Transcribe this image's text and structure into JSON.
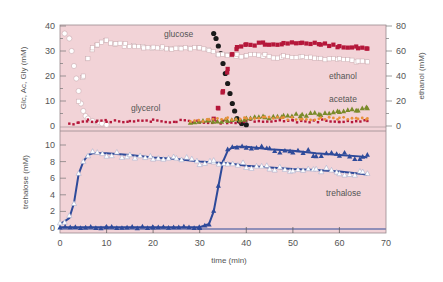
{
  "chart_data": [
    {
      "type": "scatter",
      "panel": "top",
      "xlabel": "time (min)",
      "ylabel": "Glc, Ac, Gly (mM)",
      "ylabel_right": "ethanol (mM)",
      "xlim": [
        0,
        70
      ],
      "ylim": [
        0,
        40
      ],
      "ylim_right": [
        0,
        80
      ],
      "yticks": [
        0,
        10,
        20,
        30,
        40
      ],
      "yticks_right": [
        0,
        20,
        40,
        60,
        80
      ],
      "background": "#f2d3d7",
      "annotations": [
        "glucose",
        "glycerol",
        "ethanol",
        "acetate"
      ],
      "series": [
        {
          "name": "glucose (open circles, phase 1)",
          "axis": "left",
          "marker": "open-circle",
          "color": "#ffffff",
          "x": [
            1,
            2,
            2.5,
            3,
            3.5,
            4,
            4.5,
            5,
            5.5,
            6,
            7,
            8,
            9,
            10
          ],
          "y": [
            37,
            35,
            30,
            24,
            19,
            14,
            9,
            6,
            4,
            3,
            2,
            1.5,
            1,
            0.5
          ]
        },
        {
          "name": "glucose (black circles, phase 2)",
          "axis": "left",
          "marker": "filled-circle",
          "color": "#1a1a1a",
          "x": [
            33,
            33.5,
            34,
            34.5,
            35,
            35.5,
            36,
            36.5,
            37,
            37.5,
            38,
            38.5,
            39,
            40
          ],
          "y": [
            37,
            35,
            32,
            29,
            25,
            21,
            17,
            13,
            9,
            6,
            3,
            2,
            1,
            0.5
          ]
        },
        {
          "name": "ethanol (open squares)",
          "axis": "right",
          "marker": "open-square",
          "color": "#ffffff",
          "x": [
            4,
            5,
            6,
            7,
            8,
            10,
            12,
            14,
            16,
            18,
            20,
            22,
            24,
            26,
            28,
            30,
            32,
            34,
            36,
            38,
            40,
            44,
            48,
            52,
            56,
            60,
            64,
            66
          ],
          "y": [
            20,
            40,
            55,
            62,
            66,
            68,
            66,
            65,
            64,
            63,
            62,
            63,
            62,
            62,
            62,
            63,
            60,
            58,
            57,
            56,
            57,
            56,
            55,
            55,
            54,
            53,
            52,
            51
          ]
        },
        {
          "name": "ethanol (red squares)",
          "axis": "right",
          "marker": "filled-square",
          "color": "#b5173a",
          "x": [
            33,
            34,
            35,
            36,
            37,
            38,
            40,
            44,
            48,
            52,
            56,
            60,
            64,
            66
          ],
          "y": [
            5,
            15,
            28,
            45,
            58,
            63,
            65,
            66,
            66,
            67,
            66,
            64,
            63,
            62
          ]
        },
        {
          "name": "glycerol",
          "axis": "left",
          "marker": "filled-square-small",
          "color": "#b5173a",
          "x": [
            2,
            4,
            6,
            8,
            10,
            15,
            20,
            25,
            30,
            35,
            40,
            50,
            60,
            66
          ],
          "y": [
            0.5,
            1.5,
            2,
            2,
            2,
            2,
            2,
            2,
            1.5,
            1.5,
            2,
            2,
            2,
            2
          ]
        },
        {
          "name": "acetate",
          "axis": "left",
          "marker": "triangle",
          "color": "#7a8a2a",
          "x": [
            28,
            32,
            36,
            40,
            44,
            48,
            52,
            56,
            60,
            64,
            66
          ],
          "y": [
            1.5,
            2,
            2.5,
            3,
            3.5,
            4,
            4.5,
            5,
            5.5,
            6.5,
            7.5
          ]
        },
        {
          "name": "acetate (orange)",
          "axis": "left",
          "marker": "filled-circle-small",
          "color": "#e8903a",
          "x": [
            28,
            32,
            36,
            40,
            44,
            48,
            52,
            56,
            60,
            64,
            66
          ],
          "y": [
            2,
            2.5,
            3,
            3,
            3,
            3,
            3,
            3,
            3,
            3,
            3
          ]
        }
      ]
    },
    {
      "type": "line",
      "panel": "bottom",
      "xlabel": "time (min)",
      "ylabel": "trehalose (mM)",
      "xlim": [
        0,
        70
      ],
      "ylim": [
        0,
        10
      ],
      "xticks": [
        0,
        10,
        20,
        30,
        40,
        50,
        60,
        70
      ],
      "yticks": [
        0,
        2,
        4,
        6,
        8,
        10
      ],
      "background": "#f2d3d7",
      "annotations": [
        "trehalose"
      ],
      "series": [
        {
          "name": "trehalose (open triangles, phase 1)",
          "marker": "open-triangle",
          "color": "#ffffff",
          "line_color": "#2e4a9a",
          "x": [
            0,
            1,
            2,
            3,
            4,
            5,
            6,
            7,
            8,
            10,
            15,
            20,
            25,
            30,
            33
          ],
          "y": [
            0.5,
            0.8,
            1.2,
            3,
            6.5,
            8,
            8.8,
            9,
            9,
            9,
            8.8,
            8.5,
            8.3,
            8,
            7.9
          ]
        },
        {
          "name": "trehalose (filled triangles, phase 2)",
          "marker": "filled-triangle",
          "color": "#2e4a9a",
          "line_color": "#2e4a9a",
          "x": [
            0,
            10,
            20,
            30,
            32,
            33,
            34,
            35,
            36,
            37,
            38,
            40,
            45,
            50,
            55,
            60,
            65,
            66
          ],
          "y": [
            0.1,
            0.1,
            0.1,
            0.1,
            0.5,
            2,
            5,
            8,
            9.3,
            9.7,
            9.8,
            9.8,
            9.5,
            9.3,
            9.0,
            8.8,
            8.6,
            8.5
          ]
        },
        {
          "name": "trehalose (open triangles, phase 2)",
          "marker": "open-triangle",
          "color": "#ffffff",
          "line_color": "#2e4a9a",
          "x": [
            33,
            36,
            40,
            45,
            50,
            55,
            60,
            65,
            66
          ],
          "y": [
            7.9,
            7.8,
            7.5,
            7.3,
            7.1,
            7.0,
            6.8,
            6.5,
            6.4
          ]
        }
      ]
    }
  ],
  "labels": {
    "left_axis_top": "Glc, Ac, Gly (mM)",
    "right_axis_top": "ethanol (mM)",
    "left_axis_bottom": "trehalose (mM)",
    "x_axis": "time (min)",
    "glucose": "glucose",
    "glycerol": "glycerol",
    "ethanol": "ethanol",
    "acetate": "acetate",
    "trehalose": "trehalose"
  },
  "ticks": {
    "top_left": [
      "40",
      "30",
      "20",
      "10",
      "0"
    ],
    "top_right": [
      "80",
      "60",
      "40",
      "20",
      "0"
    ],
    "bottom_left": [
      "10",
      "8",
      "6",
      "4",
      "2",
      "0"
    ],
    "x": [
      "0",
      "10",
      "20",
      "30",
      "40",
      "50",
      "60",
      "70"
    ]
  },
  "colors": {
    "plot_bg": "#f2d3d7",
    "ethanol_red": "#b5173a",
    "trehalose_blue": "#2e4a9a",
    "acetate_green": "#7a8a2a",
    "acetate_orange": "#e8903a",
    "glucose_black": "#1a1a1a"
  }
}
